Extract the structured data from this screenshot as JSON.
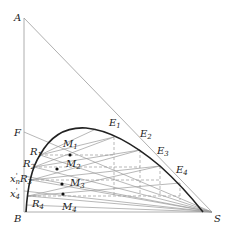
{
  "diagram": {
    "type": "ternary-right-triangle-extraction",
    "vertices": {
      "A": "A",
      "B": "B",
      "S": "S"
    },
    "feed_label": "F",
    "raffinate_labels": [
      "R1",
      "R2",
      "R3",
      "R4"
    ],
    "extract_labels": [
      "E1",
      "E2",
      "E3",
      "E4"
    ],
    "mixture_labels": [
      "M1",
      "M2",
      "M3",
      "M4"
    ],
    "axis_marks": [
      "x'n",
      "x'4"
    ]
  },
  "labels": {
    "A": "A",
    "B": "B",
    "S": "S",
    "F": "F",
    "R1": {
      "main": "R",
      "sub": "1"
    },
    "R2": {
      "main": "R",
      "sub": "2"
    },
    "R3": {
      "main": "R",
      "sub": "3"
    },
    "R4": {
      "main": "R",
      "sub": "4"
    },
    "E1": {
      "main": "E",
      "sub": "1"
    },
    "E2": {
      "main": "E",
      "sub": "2"
    },
    "E3": {
      "main": "E",
      "sub": "3"
    },
    "E4": {
      "main": "E",
      "sub": "4"
    },
    "M1": {
      "main": "M",
      "sub": "1"
    },
    "M2": {
      "main": "M",
      "sub": "2"
    },
    "M3": {
      "main": "M",
      "sub": "3"
    },
    "M4": {
      "main": "M",
      "sub": "4"
    },
    "xn": {
      "main": "x",
      "sup": "'",
      "sub": "n"
    },
    "x4": {
      "main": "x",
      "sup": "'",
      "sub": "4"
    }
  },
  "colors": {
    "curve": "#222222",
    "lines": "#9a9a9a",
    "text": "#222222"
  }
}
